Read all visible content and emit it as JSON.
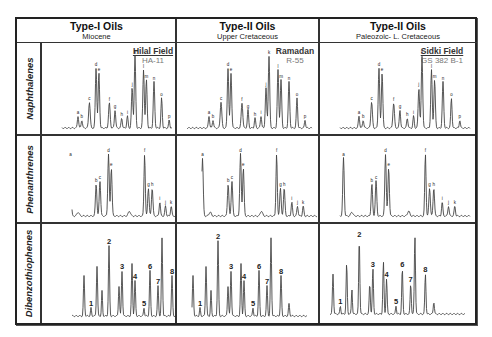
{
  "columns": [
    {
      "title": "Type-I Oils",
      "subtitle": "Miocene",
      "field": "Hilal Field",
      "well": "HA-11",
      "field_underlined": true
    },
    {
      "title": "Type-II Oils",
      "subtitle": "Upper Cretaceous",
      "field": "Ramadan",
      "well": "R-55",
      "field_underlined": false
    },
    {
      "title": "Type-II Oils",
      "subtitle": "Paleozoic- L. Cretaceous",
      "field": "Sidki Field",
      "well": "GS 382 B-1",
      "field_underlined": true
    }
  ],
  "rows": [
    {
      "label": "Naphthalenes",
      "peak_labels": [
        "a",
        "b",
        "c",
        "d",
        "e",
        "f",
        "g",
        "h",
        "i",
        "j",
        "k",
        "l",
        "m",
        "n",
        "o",
        "p"
      ]
    },
    {
      "label": "Phenanthrenes",
      "peak_labels": [
        "a",
        "b",
        "c",
        "d",
        "e",
        "f",
        "g",
        "h",
        "i",
        "j",
        "k"
      ]
    },
    {
      "label": "Dibenzothiophenes",
      "peak_labels": [
        "1",
        "2",
        "3",
        "4",
        "5",
        "6",
        "7",
        "8"
      ]
    }
  ],
  "colors": {
    "line": "#333333",
    "border": "#222222",
    "trace": "#444444"
  }
}
